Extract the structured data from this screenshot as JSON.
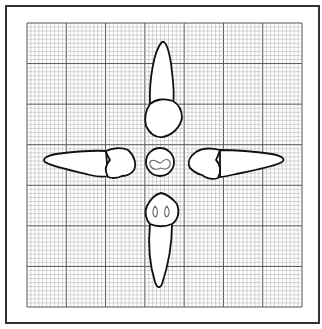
{
  "figure": {
    "frame": {
      "x": 6,
      "y": 6,
      "width": 313,
      "height": 317,
      "stroke": "#333333"
    },
    "grid": {
      "x": 27,
      "y": 23,
      "width": 275,
      "height": 284,
      "major_cells_x": 7,
      "major_cells_y": 7,
      "minor_per_major": 10,
      "major_color": "#555555",
      "minor_color": "#aaaaaa"
    },
    "teeth": [
      {
        "id": "top",
        "orientation": "root-up"
      },
      {
        "id": "left",
        "orientation": "root-left"
      },
      {
        "id": "right",
        "orientation": "root-right"
      },
      {
        "id": "bottom",
        "orientation": "root-down"
      },
      {
        "id": "center",
        "orientation": "occlusal-view"
      }
    ]
  }
}
